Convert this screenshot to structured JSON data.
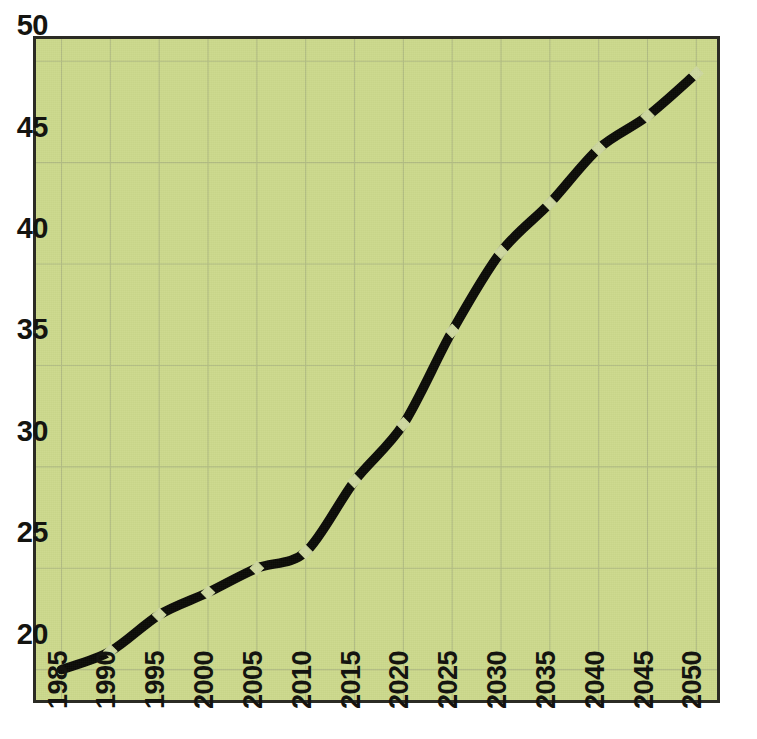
{
  "chart_data": {
    "type": "line",
    "title": "",
    "subtitle": "",
    "xlabel": "",
    "ylabel": "",
    "categories": [
      "1985",
      "1990",
      "1995",
      "2000",
      "2005",
      "2010",
      "2015",
      "2020",
      "2025",
      "2030",
      "2035",
      "2040",
      "2045",
      "2050"
    ],
    "x": [
      1985,
      1990,
      1995,
      2000,
      2005,
      2010,
      2015,
      2020,
      2025,
      2030,
      2035,
      2040,
      2045,
      2050
    ],
    "values": [
      20.0,
      20.9,
      22.7,
      23.8,
      25.0,
      25.8,
      29.3,
      32.1,
      36.7,
      40.6,
      43.0,
      45.7,
      47.3,
      49.4
    ],
    "series": [
      {
        "name": "",
        "values": [
          20.0,
          20.9,
          22.7,
          23.8,
          25.0,
          25.8,
          29.3,
          32.1,
          36.7,
          40.6,
          43.0,
          45.7,
          47.3,
          49.4
        ]
      }
    ],
    "ylim": [
      18.6,
      51.0
    ],
    "xlim": [
      1983.0,
      2051.5
    ],
    "yticks": [
      20,
      25,
      30,
      35,
      40,
      45,
      50
    ],
    "ytick_labels": [
      "20",
      "25",
      "30",
      "35",
      "40",
      "45",
      "50"
    ],
    "xticks": [
      1985,
      1990,
      1995,
      2000,
      2005,
      2010,
      2015,
      2020,
      2025,
      2030,
      2035,
      2040,
      2045,
      2050
    ],
    "xtick_labels": [
      "1985",
      "1990",
      "1995",
      "2000",
      "2005",
      "2010",
      "2015",
      "2020",
      "2025",
      "2030",
      "2035",
      "2040",
      "2045",
      "2050"
    ],
    "xtick_rotation": -90,
    "grid": true,
    "grid_axes": "both",
    "legend": false,
    "legend_position": "none",
    "annotations": [],
    "marker": "diamond",
    "line_style": "solid"
  },
  "style": {
    "background_color": "#ccd98c",
    "page_color": "#ffffff",
    "grid_color": "#b2bd83",
    "border_color": "#2b2b24",
    "line_color": "#0b0b07",
    "marker_color": "#ced8a0",
    "tick_label_color": "#141410"
  }
}
